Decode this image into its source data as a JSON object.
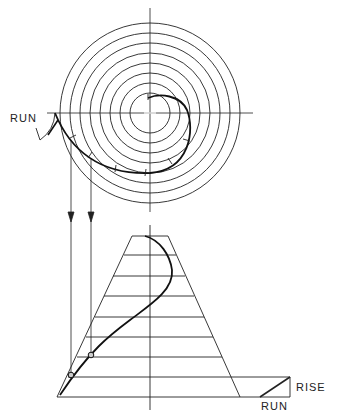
{
  "labels": {
    "run_top": "RUN",
    "rise": "RISE",
    "run_bottom": "RUN"
  },
  "colors": {
    "ink": "#222222",
    "background": "#ffffff"
  },
  "plan_view": {
    "center": [
      150,
      113
    ],
    "radii": [
      20,
      30,
      40,
      50,
      60,
      70,
      80,
      90
    ]
  },
  "elevation": {
    "top": [
      132,
      168,
      236
    ],
    "bottom": [
      57,
      240,
      397
    ],
    "rungs_y": [
      255,
      276,
      296,
      317,
      337,
      357,
      377
    ]
  }
}
